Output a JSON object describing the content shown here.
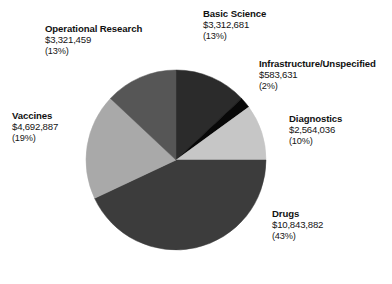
{
  "chart_data": {
    "type": "pie",
    "title": "",
    "subtitle": "",
    "xlabel": "",
    "ylabel": "",
    "legend_position": "none",
    "grid": false,
    "labels_inline": true,
    "start_angle_deg": 0,
    "direction": "clockwise",
    "categories": [
      "Basic Science",
      "Infrastructure/Unspecified",
      "Diagnostics",
      "Drugs",
      "Vaccines",
      "Operational Research"
    ],
    "values": [
      3312681,
      583631,
      2564036,
      10843882,
      4692887,
      3321459
    ],
    "percentages": [
      13,
      2,
      10,
      43,
      19,
      13
    ],
    "total": 25318576,
    "slices": [
      {
        "name": "Basic Science",
        "value": 3312681,
        "value_label": "$3,312,681",
        "percent": 13,
        "percent_label": "(13%)",
        "color": "#2b2b2b",
        "start_deg": 0,
        "end_deg": 46.8
      },
      {
        "name": "Infrastructure/Unspecified",
        "value": 583631,
        "value_label": "$583,631",
        "percent": 2,
        "percent_label": "(2%)",
        "color": "#080808",
        "start_deg": 46.8,
        "end_deg": 54
      },
      {
        "name": "Diagnostics",
        "value": 2564036,
        "value_label": "$2,564,036",
        "percent": 10,
        "percent_label": "(10%)",
        "color": "#c6c6c6",
        "start_deg": 54,
        "end_deg": 90
      },
      {
        "name": "Drugs",
        "value": 10843882,
        "value_label": "$10,843,882",
        "percent": 43,
        "percent_label": "(43%)",
        "color": "#3c3c3c",
        "start_deg": 90,
        "end_deg": 244.8
      },
      {
        "name": "Vaccines",
        "value": 4692887,
        "value_label": "$4,692,887",
        "percent": 19,
        "percent_label": "(19%)",
        "color": "#a9a9a9",
        "start_deg": 244.8,
        "end_deg": 313.2
      },
      {
        "name": "Operational Research",
        "value": 3321459,
        "value_label": "$3,321,459",
        "percent": 13,
        "percent_label": "(13%)",
        "color": "#565656",
        "start_deg": 313.2,
        "end_deg": 360
      }
    ]
  },
  "labels": {
    "basic_science": {
      "name": "Basic Science",
      "value": "$3,312,681",
      "pct": "(13%)"
    },
    "operational_research": {
      "name": "Operational Research",
      "value": "$3,321,459",
      "pct": "(13%)"
    },
    "infrastructure": {
      "name": "Infrastructure/Unspecified",
      "value": "$583,631",
      "pct": "(2%)"
    },
    "diagnostics": {
      "name": "Diagnostics",
      "value": "$2,564,036",
      "pct": "(10%)"
    },
    "drugs": {
      "name": "Drugs",
      "value": "$10,843,882",
      "pct": "(43%)"
    },
    "vaccines": {
      "name": "Vaccines",
      "value": "$4,692,887",
      "pct": "(19%)"
    }
  },
  "geometry": {
    "cx": 176,
    "cy": 160,
    "r": 90
  }
}
